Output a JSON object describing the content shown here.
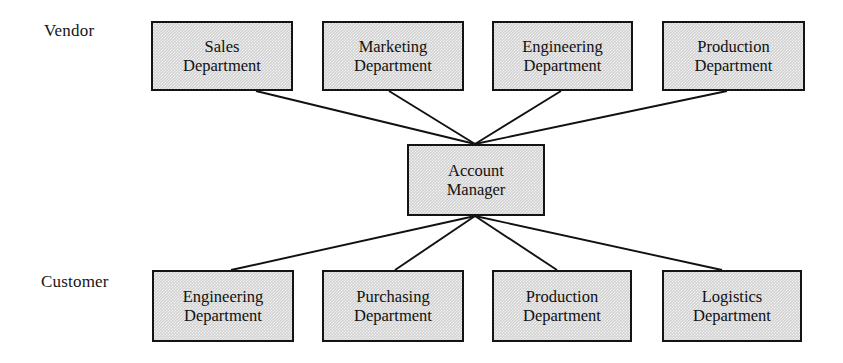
{
  "diagram": {
    "labels": {
      "vendor": "Vendor",
      "customer": "Customer"
    },
    "colors": {
      "node_fill": "#d2d2d2",
      "node_border": "#141414",
      "edge": "#111111",
      "background": "#ffffff",
      "text": "#111111"
    },
    "hub": {
      "id": "account-manager",
      "line1": "Account",
      "line2": "Manager",
      "x": 407,
      "y": 144,
      "width": 138,
      "height": 72
    },
    "vendor_nodes": [
      {
        "id": "vendor-sales",
        "line1": "Sales",
        "line2": "Department",
        "x": 151,
        "y": 21,
        "width": 142,
        "height": 70
      },
      {
        "id": "vendor-marketing",
        "line1": "Marketing",
        "line2": "Department",
        "x": 322,
        "y": 21,
        "width": 142,
        "height": 70
      },
      {
        "id": "vendor-engineering",
        "line1": "Engineering",
        "line2": "Department",
        "x": 492,
        "y": 21,
        "width": 141,
        "height": 70
      },
      {
        "id": "vendor-production",
        "line1": "Production",
        "line2": "Department",
        "x": 662,
        "y": 21,
        "width": 143,
        "height": 70
      }
    ],
    "customer_nodes": [
      {
        "id": "customer-engineering",
        "line1": "Engineering",
        "line2": "Department",
        "x": 152,
        "y": 270,
        "width": 142,
        "height": 72
      },
      {
        "id": "customer-purchasing",
        "line1": "Purchasing",
        "line2": "Department",
        "x": 322,
        "y": 270,
        "width": 142,
        "height": 72
      },
      {
        "id": "customer-production",
        "line1": "Production",
        "line2": "Department",
        "x": 492,
        "y": 270,
        "width": 140,
        "height": 72
      },
      {
        "id": "customer-logistics",
        "line1": "Logistics",
        "line2": "Department",
        "x": 662,
        "y": 270,
        "width": 140,
        "height": 72
      }
    ],
    "edges": [
      {
        "id": "edge-sales-hub",
        "from": "vendor-sales",
        "to": "account-manager",
        "x1": 256,
        "y1": 91,
        "x2": 475,
        "y2": 144
      },
      {
        "id": "edge-marketing-hub",
        "from": "vendor-marketing",
        "to": "account-manager",
        "x1": 389,
        "y1": 91,
        "x2": 475,
        "y2": 144
      },
      {
        "id": "edge-engineering-hub",
        "from": "vendor-engineering",
        "to": "account-manager",
        "x1": 561,
        "y1": 91,
        "x2": 475,
        "y2": 144
      },
      {
        "id": "edge-production-hub",
        "from": "vendor-production",
        "to": "account-manager",
        "x1": 727,
        "y1": 91,
        "x2": 475,
        "y2": 144
      },
      {
        "id": "edge-hub-engineering",
        "from": "account-manager",
        "to": "customer-engineering",
        "x1": 475,
        "y1": 216,
        "x2": 231,
        "y2": 270
      },
      {
        "id": "edge-hub-purchasing",
        "from": "account-manager",
        "to": "customer-purchasing",
        "x1": 475,
        "y1": 216,
        "x2": 395,
        "y2": 270
      },
      {
        "id": "edge-hub-production",
        "from": "account-manager",
        "to": "customer-production",
        "x1": 475,
        "y1": 216,
        "x2": 557,
        "y2": 270
      },
      {
        "id": "edge-hub-logistics",
        "from": "account-manager",
        "to": "customer-logistics",
        "x1": 475,
        "y1": 216,
        "x2": 722,
        "y2": 270
      }
    ]
  }
}
